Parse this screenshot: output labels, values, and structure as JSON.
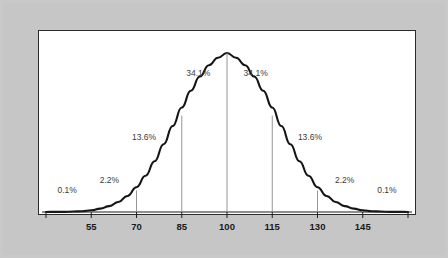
{
  "figure": {
    "frame_color": "#c9c9c9",
    "panel_color": "#ffffff",
    "panel_border_color": "#2b2b2b",
    "curve_color": "#141414",
    "sd_line_color": "#8a8a8a",
    "axis_color": "#1f1f1f",
    "label_color": "#1a1a1a",
    "pct_label_color": "#3a3a3a"
  },
  "chart_data": {
    "type": "line",
    "title": "",
    "subtitle": "",
    "xlabel": "",
    "ylabel": "",
    "grid": false,
    "legend": "none",
    "distribution": "normal",
    "mean": 100,
    "std_dev": 15,
    "xlim": [
      40,
      160
    ],
    "ylim": [
      0,
      1
    ],
    "x_ticks": [
      40,
      55,
      70,
      85,
      100,
      115,
      130,
      145,
      160
    ],
    "x_tick_labels": [
      "",
      "55",
      "70",
      "85",
      "100",
      "115",
      "130",
      "145",
      ""
    ],
    "annotations": [
      {
        "text": "0.1%",
        "x_center": 47.5,
        "x_label": 47.0,
        "y_label": 0.12
      },
      {
        "text": "2.2%",
        "x_center": 62.5,
        "x_label": 61.0,
        "y_label": 0.185
      },
      {
        "text": "13.6%",
        "x_center": 77.5,
        "x_label": 72.5,
        "y_label": 0.455
      },
      {
        "text": "34.1%",
        "x_center": 92.5,
        "x_label": 90.5,
        "y_label": 0.855
      },
      {
        "text": "34.1%",
        "x_center": 107.5,
        "x_label": 109.5,
        "y_label": 0.855
      },
      {
        "text": "13.6%",
        "x_center": 122.5,
        "x_label": 127.5,
        "y_label": 0.455
      },
      {
        "text": "2.2%",
        "x_center": 137.5,
        "x_label": 139.0,
        "y_label": 0.185
      },
      {
        "text": "0.1%",
        "x_center": 152.5,
        "x_label": 153.0,
        "y_label": 0.12
      }
    ],
    "sd_marker_lines": [
      70,
      85,
      100,
      115,
      130
    ],
    "series": [
      {
        "name": "Normal distribution (mean 100, SD 15)",
        "x": [
          40,
          43,
          46,
          49,
          52,
          55,
          58,
          61,
          64,
          67,
          70,
          73,
          76,
          79,
          82,
          85,
          88,
          91,
          94,
          97,
          100,
          103,
          106,
          109,
          112,
          115,
          118,
          121,
          124,
          127,
          130,
          133,
          136,
          139,
          142,
          145,
          148,
          151,
          154,
          157,
          160
        ],
        "y": [
          0.0,
          0.001,
          0.001,
          0.003,
          0.005,
          0.011,
          0.021,
          0.037,
          0.063,
          0.101,
          0.156,
          0.228,
          0.319,
          0.426,
          0.541,
          0.657,
          0.763,
          0.852,
          0.923,
          0.97,
          1.0,
          0.97,
          0.923,
          0.852,
          0.763,
          0.657,
          0.541,
          0.426,
          0.319,
          0.228,
          0.156,
          0.101,
          0.063,
          0.037,
          0.021,
          0.011,
          0.005,
          0.003,
          0.001,
          0.001,
          0.0
        ]
      }
    ]
  },
  "axis": {
    "tick_55": "55",
    "tick_70": "70",
    "tick_85": "85",
    "tick_100": "100",
    "tick_115": "115",
    "tick_130": "130",
    "tick_145": "145"
  },
  "percent_labels": {
    "left_0_1": "0.1%",
    "left_2_2": "2.2%",
    "left_13_6": "13.6%",
    "left_34_1": "34.1%",
    "right_34_1": "34.1%",
    "right_13_6": "13.6%",
    "right_2_2": "2.2%",
    "right_0_1": "0.1%"
  }
}
